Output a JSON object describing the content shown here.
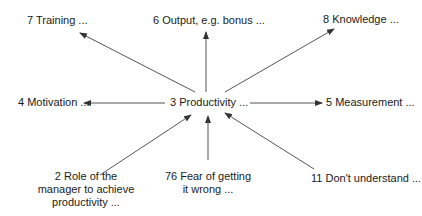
{
  "diagram": {
    "center": {
      "label": "3 Productivity ..."
    },
    "nodes": [
      {
        "id": "training",
        "label": "7 Training ..."
      },
      {
        "id": "output",
        "label": "6 Output, e.g. bonus ..."
      },
      {
        "id": "knowledge",
        "label": "8 Knowledge ..."
      },
      {
        "id": "motivation",
        "label": "4 Motivation ..."
      },
      {
        "id": "measurement",
        "label": "5 Measurement ..."
      },
      {
        "id": "role",
        "label_lines": [
          "2 Role of the",
          "manager to achieve",
          "productivity ..."
        ]
      },
      {
        "id": "fear",
        "label_lines": [
          "76 Fear of getting",
          "it wrong ..."
        ]
      },
      {
        "id": "dont-understand",
        "label": "11 Don't understand ..."
      }
    ],
    "edges": [
      {
        "from": "center",
        "to": "training",
        "direction": "outward"
      },
      {
        "from": "center",
        "to": "output",
        "direction": "outward"
      },
      {
        "from": "center",
        "to": "knowledge",
        "direction": "outward"
      },
      {
        "from": "center",
        "to": "motivation",
        "direction": "outward"
      },
      {
        "from": "center",
        "to": "measurement",
        "direction": "outward"
      },
      {
        "from": "role",
        "to": "center",
        "direction": "inward"
      },
      {
        "from": "fear",
        "to": "center",
        "direction": "inward"
      },
      {
        "from": "dont-understand",
        "to": "center",
        "direction": "inward"
      }
    ],
    "colors": {
      "line": "#333333",
      "text": "#1a1a1a",
      "background": "#ffffff"
    }
  }
}
